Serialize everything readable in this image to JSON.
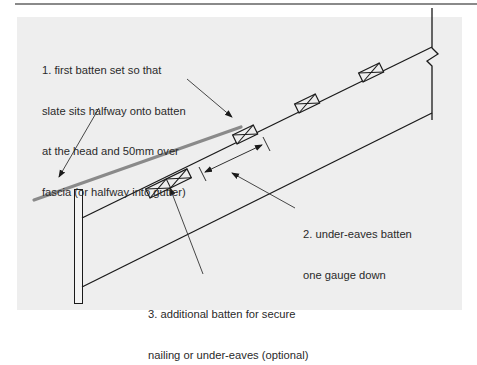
{
  "header": {
    "text": "ROOF SLATING"
  },
  "diagram": {
    "colors": {
      "panel_background": "#eeeeee",
      "line": "#1a1a1a",
      "slate": "#888888",
      "text": "#2a2a2a"
    },
    "labels": [
      {
        "id": "first-batten",
        "number": "1.",
        "lines": [
          "1. first batten set so that",
          "slate sits halfway onto batten",
          "at the head and 50mm over",
          "fascia (or halfway into gutter)"
        ]
      },
      {
        "id": "under-eaves-batten",
        "number": "2.",
        "lines": [
          "2. under-eaves batten",
          "one gauge down"
        ]
      },
      {
        "id": "additional-batten",
        "number": "3.",
        "lines": [
          "3. additional batten for secure",
          "nailing or under-eaves (optional)"
        ]
      }
    ],
    "components": [
      "fascia-post",
      "upper-rafter-line",
      "lower-rafter-line",
      "wall",
      "slate",
      "battens",
      "gauge-dimension"
    ]
  }
}
